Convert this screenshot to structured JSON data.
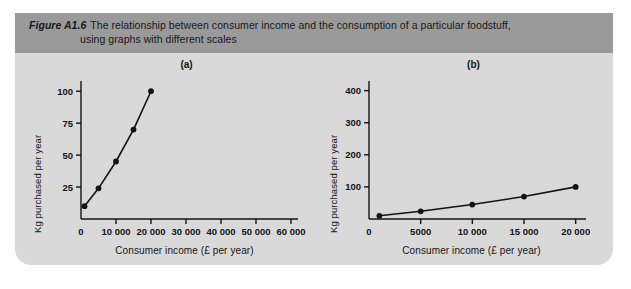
{
  "figure": {
    "number_label": "Figure A1.6",
    "caption_line_1": "The relationship between consumer income and the consumption of a particular foodstuff,",
    "caption_line_2": "using graphs with different scales",
    "band_color": "#9a9a9a",
    "panel_color": "#d9d9d9",
    "ink_color": "#131315"
  },
  "chart_data": [
    {
      "type": "line",
      "title": "(a)",
      "xlabel": "Consumer income (£ per year)",
      "ylabel": "Kg purchased per year",
      "xlim": [
        0,
        62000
      ],
      "ylim": [
        0,
        108
      ],
      "xticks": [
        0,
        10000,
        20000,
        30000,
        40000,
        50000,
        60000
      ],
      "xticklabels": [
        "0",
        "10 000",
        "20 000",
        "30 000",
        "40 000",
        "50 000",
        "60 000"
      ],
      "yticks": [
        25,
        50,
        75,
        100
      ],
      "yticklabels": [
        "25",
        "50",
        "75",
        "100"
      ],
      "grid": false,
      "legend": "none",
      "marker": "filled-circle",
      "x": [
        1000,
        5000,
        10000,
        15000,
        20000
      ],
      "values": [
        10,
        24,
        45,
        70,
        100
      ]
    },
    {
      "type": "line",
      "title": "(b)",
      "xlabel": "Consumer income (£ per year)",
      "ylabel": "Kg purchased per year",
      "xlim": [
        0,
        21000
      ],
      "ylim": [
        0,
        430
      ],
      "xticks": [
        0,
        5000,
        10000,
        15000,
        20000
      ],
      "xticklabels": [
        "0",
        "5000",
        "10 000",
        "15 000",
        "20 000"
      ],
      "yticks": [
        100,
        200,
        300,
        400
      ],
      "yticklabels": [
        "100",
        "200",
        "300",
        "400"
      ],
      "grid": false,
      "legend": "none",
      "marker": "filled-circle",
      "x": [
        1000,
        5000,
        10000,
        15000,
        20000
      ],
      "values": [
        10,
        24,
        45,
        70,
        100
      ]
    }
  ]
}
